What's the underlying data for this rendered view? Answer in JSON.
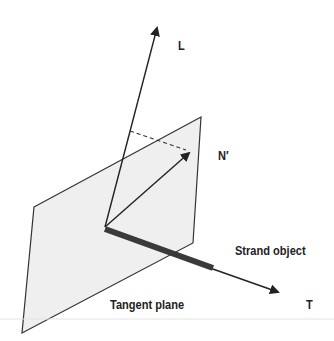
{
  "diagram": {
    "labels": {
      "light_vector": "L",
      "projected_normal": "N′",
      "strand": "Strand object",
      "plane": "Tangent plane",
      "tangent": "T"
    },
    "colors": {
      "plane_fill": "#efefef",
      "stroke": "#222222",
      "strand": "#3a3a3a"
    }
  }
}
